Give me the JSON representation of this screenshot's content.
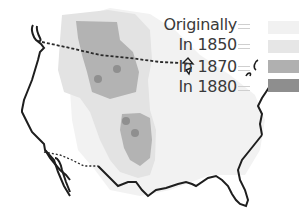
{
  "map": {
    "subject": "Range of the American bison",
    "region": "Contiguous United States",
    "layers": [
      {
        "id": "originally",
        "label": "Originally",
        "color": "#f1f1f1"
      },
      {
        "id": "in_1850",
        "label": "In 1850",
        "color": "#e4e4e4"
      },
      {
        "id": "in_1870",
        "label": "In 1870",
        "color": "#b3b3b3"
      },
      {
        "id": "in_1880",
        "label": "In 1880",
        "color": "#8f8f8f"
      }
    ]
  },
  "legend": {
    "items": [
      {
        "label": "Originally",
        "color": "#f1f1f1"
      },
      {
        "label": "In 1850",
        "color": "#e6e6e6"
      },
      {
        "label": "In 1870",
        "color": "#b0b0b0"
      },
      {
        "label": "In 1880",
        "color": "#8e8e8e"
      }
    ]
  },
  "colors": {
    "outline": "#1e1e1e",
    "border_dotted": "#2a2a2a",
    "background": "#ffffff"
  }
}
